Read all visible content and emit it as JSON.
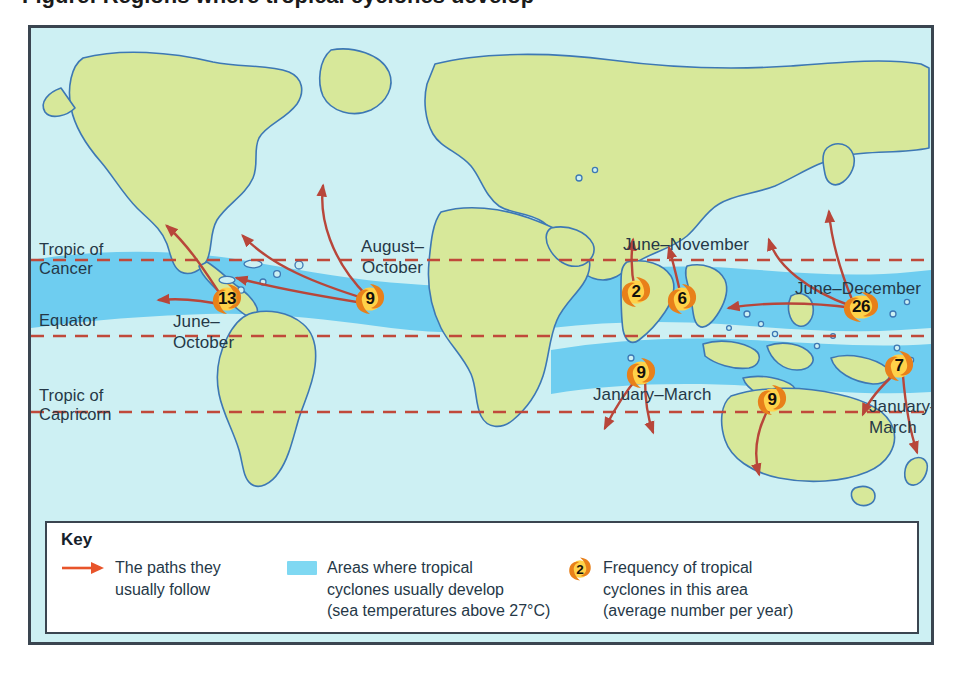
{
  "figure": {
    "title_cropped": "Figure: Regions where tropical cyclones develop"
  },
  "map": {
    "latitude_lines": [
      {
        "id": "tropic-of-cancer",
        "label": "Tropic of\nCancer"
      },
      {
        "id": "equator",
        "label": "Equator"
      },
      {
        "id": "tropic-of-capricorn",
        "label": "Tropic of\nCapricorn"
      }
    ],
    "season_labels": [
      {
        "id": "north-atlantic",
        "label": "August–\nOctober"
      },
      {
        "id": "east-pacific",
        "label": "June–\nOctober"
      },
      {
        "id": "north-indian",
        "label": "June–November"
      },
      {
        "id": "west-pacific",
        "label": "June–December"
      },
      {
        "id": "south-indian",
        "label": "January–March"
      },
      {
        "id": "south-pacific",
        "label": "January–\nMarch"
      }
    ],
    "cyclone_markers": [
      {
        "id": "east-pacific",
        "value": "13"
      },
      {
        "id": "north-atlantic",
        "value": "9"
      },
      {
        "id": "arabian-sea",
        "value": "2"
      },
      {
        "id": "bay-of-bengal",
        "value": "6"
      },
      {
        "id": "northwest-pacific",
        "value": "26"
      },
      {
        "id": "southwest-indian",
        "value": "9"
      },
      {
        "id": "northwest-australia",
        "value": "9"
      },
      {
        "id": "south-pacific",
        "value": "7"
      }
    ]
  },
  "key": {
    "title": "Key",
    "items": [
      {
        "icon": "arrow-icon",
        "text": "The paths they\nusually follow"
      },
      {
        "icon": "area-swatch",
        "text": "Areas where tropical\ncyclones usually develop\n(sea temperatures above 27°C)"
      },
      {
        "icon": "cyclone-icon",
        "icon_value": "2",
        "text": "Frequency of tropical\ncyclones in this area\n(average number per year)"
      }
    ]
  },
  "colors": {
    "ocean": "#cdf0f3",
    "land": "#d7e89a",
    "warm_water_band": "#6ecdf0",
    "coastline": "#3d78b4",
    "latitude_line": "#c0493a",
    "arrow": "#b8463a",
    "key_arrow": "#e8542a",
    "frame": "#3a4550",
    "text": "#253847",
    "cyclone_outer": "#e8801a",
    "cyclone_inner": "#ffd24a"
  }
}
